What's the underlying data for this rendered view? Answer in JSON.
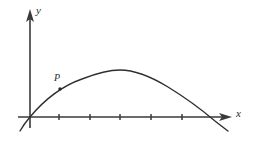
{
  "figure": {
    "kind": "coordinate-plane-curve-diagram",
    "background_color": "#ffffff",
    "width": 259,
    "height": 141,
    "axis_color": "#3a3a3a",
    "curve_color": "#2e2e2e",
    "origin": {
      "x": 30,
      "y": 117
    }
  },
  "labels": {
    "y_axis": "y",
    "x_axis": "x",
    "point": "P"
  },
  "axes": {
    "x_axis": {
      "start_x": 18,
      "end_x": 232,
      "y": 117,
      "arrow": "right",
      "tick_positions": [
        59,
        90,
        120,
        151,
        182
      ],
      "tick_half_length": 3
    },
    "y_axis": {
      "x": 30,
      "start_y": 128,
      "end_y": 10,
      "arrow": "up"
    }
  },
  "chart_data": {
    "type": "line",
    "title": "",
    "xlabel": "x",
    "ylabel": "y",
    "grid": false,
    "legend": null,
    "curve_description": "downward-opening parabola through the origin peaking near the middle and crossing the x-axis again on the right",
    "path_d": "M 20 131 Q 24 124 30 117 C 45 99 62 86 82 79 C 100 72 112 70 120 70 C 133 70 150 76 168 87 C 186 98 202 110 215 121 C 220 125 224 128 228 131",
    "points": [
      {
        "name": "P",
        "x": 60,
        "y": 89,
        "label": "P",
        "marker": "dot",
        "radius": 1.7
      }
    ],
    "x_intercepts": [
      30,
      212
    ],
    "vertex": {
      "x": 120,
      "y": 70
    }
  }
}
